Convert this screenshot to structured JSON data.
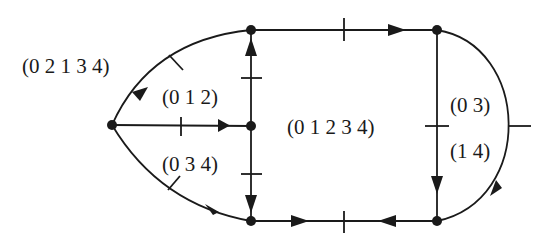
{
  "diagram": {
    "stroke_color": "#1a1a1a",
    "background": "#ffffff",
    "nodes": [
      {
        "id": "A",
        "x": 112,
        "y": 125
      },
      {
        "id": "TL",
        "x": 251,
        "y": 30
      },
      {
        "id": "M",
        "x": 251,
        "y": 126
      },
      {
        "id": "BL",
        "x": 251,
        "y": 221
      },
      {
        "id": "TR",
        "x": 437,
        "y": 30
      },
      {
        "id": "BR",
        "x": 437,
        "y": 221
      }
    ],
    "labels": {
      "outer_left": "(0 2 1 3 4)",
      "upper_left": "(0 1 2)",
      "lower_left": "(0 3 4)",
      "center": "(0 1 2 3 4)",
      "right_upper": "(0 3)",
      "right_lower": "(1 4)"
    }
  }
}
